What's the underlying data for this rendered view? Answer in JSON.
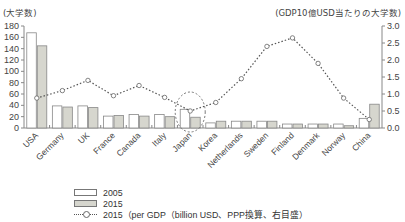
{
  "chart_data": {
    "type": "bar",
    "title": "",
    "left_axis_title": "(大学数)",
    "right_axis_title": "(GDP10億USD当たりの大学数)",
    "xlabel": "",
    "ylabel": "大学数",
    "y2label": "GDP10億USD当たりの大学数",
    "ylim": [
      0,
      180
    ],
    "y2lim": [
      0,
      3.0
    ],
    "yticks": [
      0,
      20,
      40,
      60,
      80,
      100,
      120,
      140,
      160,
      180
    ],
    "y2ticks": [
      "0.0",
      "0.5",
      "1.0",
      "1.5",
      "2.0",
      "2.5",
      "3.0"
    ],
    "categories": [
      "USA",
      "Germany",
      "UK",
      "France",
      "Canada",
      "Italy",
      "Japan",
      "Korea",
      "Netherlands",
      "Sweden",
      "Finland",
      "Denmark",
      "Norway",
      "China"
    ],
    "series": [
      {
        "name": "2005",
        "type": "bar",
        "axis": "left",
        "color": "#ffffff",
        "values": [
          168,
          39,
          39,
          21,
          24,
          24,
          33,
          9,
          12,
          12,
          7,
          7,
          7,
          17
        ]
      },
      {
        "name": "2015",
        "type": "bar",
        "axis": "left",
        "color": "#d6d6ce",
        "values": [
          145,
          37,
          36,
          22,
          21,
          20,
          19,
          12,
          12,
          12,
          7,
          7,
          4,
          42
        ]
      },
      {
        "name": "2015 (per GDP (billion USD, PPP換算, 右目盛)",
        "type": "line",
        "axis": "right",
        "style": "dotted",
        "marker": "circle",
        "values": [
          0.88,
          1.1,
          1.4,
          0.95,
          1.25,
          0.9,
          0.5,
          0.75,
          1.45,
          2.4,
          2.65,
          1.9,
          0.88,
          0.25
        ]
      }
    ],
    "annotations": [
      "dashed circle highlighting Japan"
    ],
    "grid": false,
    "legend_position": "bottom-left"
  },
  "legend": {
    "items": [
      {
        "label": "2005"
      },
      {
        "label": "2015"
      },
      {
        "label": "2015（per GDP（billion USD、PPP換算、右目盛）"
      }
    ]
  }
}
